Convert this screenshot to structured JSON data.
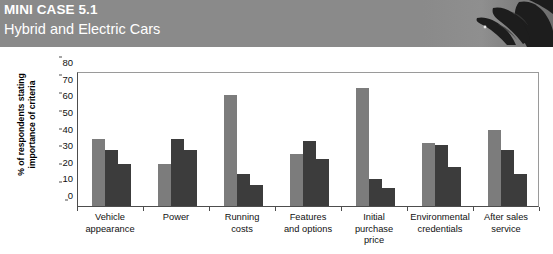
{
  "header": {
    "case_label": "MINI CASE 5.1",
    "case_title": "Hybrid and Electric Cars",
    "banner_color": "#8a8a8a",
    "banner_art_name": "eagle-photo"
  },
  "chart_data": {
    "type": "bar",
    "title": "",
    "xlabel": "",
    "ylabel": "% of respondents stating\nimportance of criteria",
    "ylim": [
      0,
      80
    ],
    "yticks": [
      0,
      10,
      20,
      30,
      40,
      50,
      60,
      70,
      80
    ],
    "grid": false,
    "legend": "none",
    "categories": [
      "Vehicle\nappearance",
      "Power",
      "Running\ncosts",
      "Features\nand options",
      "Initial\npurchase\nprice",
      "Environmental\ncredentials",
      "After sales\nservice"
    ],
    "series": [
      {
        "name": "Series 1",
        "color": "#7c7c7c",
        "values": [
          40.5,
          25,
          67,
          31.5,
          71,
          38,
          45.5
        ]
      },
      {
        "name": "Series 2",
        "color": "#3c3c3c",
        "values": [
          33.5,
          40.5,
          19.5,
          39,
          16.5,
          36.5,
          33.5
        ]
      },
      {
        "name": "Series 3",
        "color": "#3c3c3c",
        "values": [
          25,
          33.5,
          12.5,
          28,
          11,
          23.5,
          19.5
        ]
      }
    ]
  },
  "footer": {
    "clipped_caption": ""
  }
}
